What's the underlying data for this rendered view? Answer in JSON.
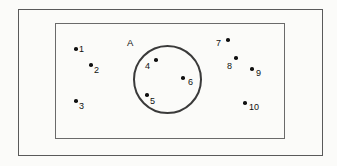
{
  "diagram": {
    "background_color": "#fbfbf9",
    "outer_frame": {
      "name": "outer-rectangle",
      "stroke": "#5a5a5a",
      "x": 18,
      "y": 9,
      "width": 305,
      "height": 147
    },
    "inner_frame": {
      "name": "inner-rectangle-universal-set",
      "stroke": "#6a6a6a",
      "x": 55,
      "y": 23,
      "width": 230,
      "height": 116
    },
    "circle": {
      "name": "set-A-circle",
      "label": "A",
      "stroke": "#3a3a3a",
      "cx": 167.5,
      "cy": 79.5,
      "r": 34.5,
      "label_x": 127,
      "label_y": 38
    },
    "points": [
      {
        "id": "1",
        "label": "1",
        "inside_circle": false,
        "dot_x": 74,
        "dot_y": 47,
        "label_x": 79,
        "label_y": 45
      },
      {
        "id": "2",
        "label": "2",
        "inside_circle": false,
        "dot_x": 89,
        "dot_y": 63,
        "label_x": 94,
        "label_y": 66
      },
      {
        "id": "3",
        "label": "3",
        "inside_circle": false,
        "dot_x": 74,
        "dot_y": 99,
        "label_x": 79,
        "label_y": 102
      },
      {
        "id": "4",
        "label": "4",
        "inside_circle": true,
        "dot_x": 154,
        "dot_y": 58,
        "label_x": 145,
        "label_y": 62
      },
      {
        "id": "5",
        "label": "5",
        "inside_circle": true,
        "dot_x": 145,
        "dot_y": 93,
        "label_x": 150,
        "label_y": 97
      },
      {
        "id": "6",
        "label": "6",
        "inside_circle": true,
        "dot_x": 181,
        "dot_y": 76,
        "label_x": 188,
        "label_y": 78
      },
      {
        "id": "7",
        "label": "7",
        "inside_circle": false,
        "dot_x": 226,
        "dot_y": 38,
        "label_x": 216,
        "label_y": 39
      },
      {
        "id": "8",
        "label": "8",
        "inside_circle": false,
        "dot_x": 234,
        "dot_y": 56,
        "label_x": 227,
        "label_y": 62
      },
      {
        "id": "9",
        "label": "9",
        "inside_circle": false,
        "dot_x": 250,
        "dot_y": 67,
        "label_x": 256,
        "label_y": 69
      },
      {
        "id": "10",
        "label": "10",
        "inside_circle": false,
        "dot_x": 243,
        "dot_y": 101,
        "label_x": 249,
        "label_y": 103
      }
    ]
  }
}
